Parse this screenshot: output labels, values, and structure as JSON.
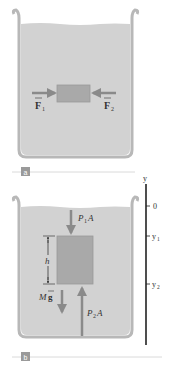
{
  "panels": [
    {
      "id": "a",
      "badge": "a",
      "forces": [
        {
          "symbol": "F",
          "subscript": "1",
          "direction": "right"
        },
        {
          "symbol": "F",
          "subscript": "2",
          "direction": "left"
        }
      ]
    },
    {
      "id": "b",
      "badge": "b",
      "forces": {
        "top": {
          "label": "P",
          "sub": "1",
          "suffix": "A",
          "direction": "down"
        },
        "bottom": {
          "label": "P",
          "sub": "2",
          "suffix": "A",
          "direction": "up"
        },
        "weight": {
          "label": "M",
          "vector": "g",
          "direction": "down"
        }
      },
      "height_label": "h",
      "axis": {
        "label": "y",
        "ticks": [
          {
            "label": "0",
            "sub": ""
          },
          {
            "label": "y",
            "sub": "1"
          },
          {
            "label": "y",
            "sub": "2"
          }
        ]
      }
    }
  ],
  "colors": {
    "fluid": "#d2d2d2",
    "beaker": "#ffffff",
    "beaker_outline": "#b8b8b8",
    "block": "#a9a9a9",
    "arrow": "#8a8a8a",
    "badge": "#9a9a9a",
    "axis": "#222222"
  }
}
